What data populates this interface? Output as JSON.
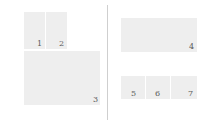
{
  "figure": {
    "type": "panel-layout-figure",
    "background_color": "#ffffff",
    "panel_color": "#eeeeee",
    "label_color": "#5b5b5b",
    "divider_color": "#cfcfcf",
    "columns": [
      {
        "name": "left-column",
        "panels": [
          {
            "label": "1",
            "x": 24,
            "y": 12,
            "w": 21,
            "h": 37,
            "label_x": 37,
            "label_y": 40
          },
          {
            "label": "2",
            "x": 46,
            "y": 12,
            "w": 21,
            "h": 37,
            "label_x": 59,
            "label_y": 40
          },
          {
            "label": "3",
            "x": 24,
            "y": 51,
            "w": 76,
            "h": 54,
            "label_x": 93,
            "label_y": 96
          }
        ]
      },
      {
        "name": "right-column",
        "panels": [
          {
            "label": "4",
            "x": 121,
            "y": 18,
            "w": 76,
            "h": 34,
            "label_x": 189,
            "label_y": 43
          },
          {
            "label": "5",
            "x": 121,
            "y": 76,
            "w": 24,
            "h": 23,
            "label_x": 131,
            "label_y": 90
          },
          {
            "label": "6",
            "x": 146,
            "y": 76,
            "w": 24,
            "h": 23,
            "label_x": 155,
            "label_y": 90
          },
          {
            "label": "7",
            "x": 171,
            "y": 76,
            "w": 26,
            "h": 23,
            "label_x": 188,
            "label_y": 90
          }
        ]
      }
    ],
    "divider": {
      "x": 107,
      "y": 5,
      "w": 1,
      "h": 115
    }
  }
}
